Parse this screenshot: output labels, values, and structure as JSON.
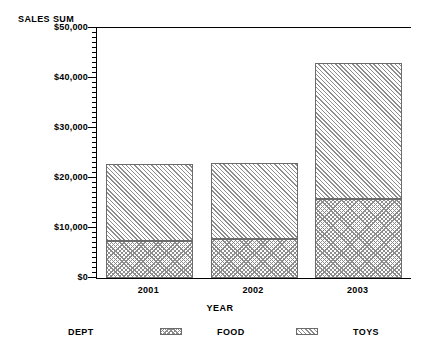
{
  "chart_data": {
    "type": "bar",
    "subtype": "stacked-vertical",
    "title": "",
    "xlabel": "YEAR",
    "ylabel": "SALES SUM",
    "categories": [
      "2001",
      "2002",
      "2003"
    ],
    "series": [
      {
        "name": "FOOD",
        "pattern": "cross-hatch",
        "values": [
          7400,
          7800,
          15800
        ]
      },
      {
        "name": "TOYS",
        "pattern": "diagonal-hatch",
        "values": [
          15400,
          15200,
          27200
        ]
      }
    ],
    "totals": [
      22800,
      23000,
      43000
    ],
    "ylim": [
      0,
      50000
    ],
    "ytick_values": [
      0,
      10000,
      20000,
      30000,
      40000,
      50000
    ],
    "ytick_labels": [
      "$0",
      "$10,000",
      "$20,000",
      "$30,000",
      "$40,000",
      "$50,000"
    ],
    "yminor_step": 1000,
    "grid": false,
    "legend_position": "bottom",
    "legend_title": "DEPT",
    "legend_entries": [
      "FOOD",
      "TOYS"
    ],
    "colors": {
      "axis": "#000000",
      "hatch": "#8d8d8d",
      "bar_border": "#6b6b6b",
      "background": "#ffffff"
    }
  }
}
